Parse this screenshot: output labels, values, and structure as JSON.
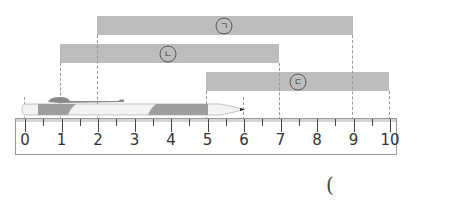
{
  "diagram": {
    "type": "ruler-length-comparison",
    "ruler": {
      "min": 0,
      "max": 10,
      "labels": [
        "0",
        "1",
        "2",
        "3",
        "4",
        "5",
        "6",
        "7",
        "8",
        "9",
        "10"
      ],
      "minor_step": 0.5
    },
    "pen": {
      "start": 0,
      "end": 6,
      "colors": {
        "body": "#f2f2f2",
        "band": "#9e9e9e",
        "clip": "#8a8a8a"
      }
    },
    "bars": [
      {
        "id": "giyeok",
        "label": "ㄱ",
        "start": 2,
        "end": 9
      },
      {
        "id": "nieun",
        "label": "ㄴ",
        "start": 1,
        "end": 7
      },
      {
        "id": "digeut",
        "label": "ㄷ",
        "start": 5,
        "end": 10
      }
    ],
    "bar_color": "#bdbdbd",
    "answer_paren": "("
  }
}
